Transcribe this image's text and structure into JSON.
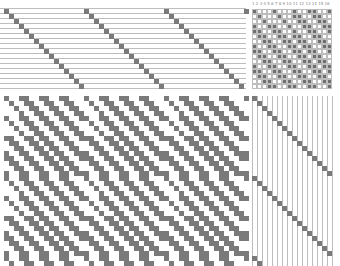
{
  "draft": {
    "title": "Weaving draft",
    "shafts": 16,
    "treadles": 16,
    "cell_px": 5,
    "colors": {
      "filled": "#7a7a7a",
      "tieup_filled": "#6f6f6f",
      "grid_line": "#bdbdbd",
      "background": "#ffffff"
    },
    "tieup_header": [
      "1",
      "2",
      "3",
      "4",
      "5",
      "6",
      "7",
      "8",
      "9",
      "10",
      "11",
      "12",
      "13",
      "14",
      "15",
      "16"
    ],
    "threading": {
      "ends": 49,
      "sequence": "straight draw 1-16 repeated"
    },
    "treadling": {
      "picks": 34,
      "sequence": "straight 1-16 repeated"
    },
    "tieup": [
      "1000100010011001",
      "0100010011001100",
      "0010001001100110",
      "1001100100110011",
      "1100110010011001",
      "0110011011001100",
      "0011001101100110",
      "1001100110110011",
      "1100110011011001",
      "0110011001101100",
      "0011001100110110",
      "1001100110011011",
      "1100110011001101",
      "0110011001100110",
      "0011001100110011",
      "0001100110011001"
    ]
  }
}
